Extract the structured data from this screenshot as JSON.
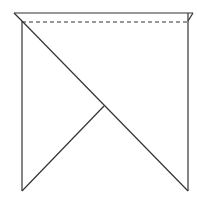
{
  "diagram": {
    "title": "",
    "stroke_color": "#333333",
    "background": "#ffffff",
    "segments": [
      {
        "id": "top-edge",
        "x1": 14,
        "y1": 13,
        "x2": 193,
        "y2": 13,
        "dashed": false
      },
      {
        "id": "fold-line",
        "x1": 22,
        "y1": 22,
        "x2": 187,
        "y2": 22,
        "dashed": true
      },
      {
        "id": "top-left-corner",
        "x1": 14,
        "y1": 13,
        "x2": 22,
        "y2": 21,
        "dashed": false
      },
      {
        "id": "top-right-corner",
        "x1": 193,
        "y1": 13,
        "x2": 188,
        "y2": 21,
        "dashed": false
      },
      {
        "id": "left-edge",
        "x1": 22,
        "y1": 21,
        "x2": 22,
        "y2": 191,
        "dashed": false
      },
      {
        "id": "right-edge",
        "x1": 188,
        "y1": 13,
        "x2": 188,
        "y2": 191,
        "dashed": false
      },
      {
        "id": "main-diagonal",
        "x1": 22,
        "y1": 21,
        "x2": 188,
        "y2": 191,
        "dashed": false
      },
      {
        "id": "inner-diagonal",
        "x1": 104,
        "y1": 106,
        "x2": 22,
        "y2": 191,
        "dashed": false
      }
    ]
  }
}
